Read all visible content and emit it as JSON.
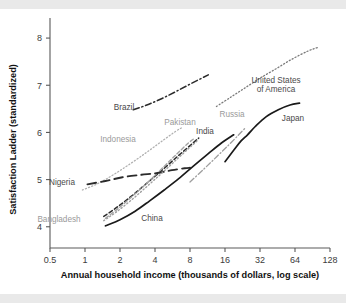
{
  "figure": {
    "background": "#ffffff",
    "band_color": "#e9e9e9"
  },
  "chart_data": {
    "type": "line",
    "title": "",
    "subtitle": "",
    "xlabel": "Annual household income (thousands of dollars, log scale)",
    "ylabel": "Satisfaction Ladder (standardized)",
    "xscale": "log2",
    "xticks": [
      "0.5",
      "1",
      "2",
      "4",
      "8",
      "16",
      "32",
      "64",
      "128"
    ],
    "xtick_values": [
      0.5,
      1,
      2,
      4,
      8,
      16,
      32,
      64,
      128
    ],
    "yticks": [
      "4",
      "5",
      "6",
      "7",
      "8"
    ],
    "ytick_values": [
      4,
      5,
      6,
      7,
      8
    ],
    "xlim": [
      0.5,
      128
    ],
    "ylim": [
      3.55,
      8.15
    ],
    "grid": false,
    "legend": "inline-labels",
    "series": [
      {
        "name": "United States of America",
        "color": "#7a7a7a",
        "style": "dotted",
        "width": 1.3,
        "label_lines": [
          "United States",
          "of America"
        ],
        "label_xy": [
          276,
          74
        ],
        "points": [
          [
            13.5,
            6.55
          ],
          [
            18,
            6.75
          ],
          [
            24,
            6.95
          ],
          [
            32,
            7.15
          ],
          [
            44,
            7.35
          ],
          [
            60,
            7.55
          ],
          [
            82,
            7.72
          ],
          [
            100,
            7.8
          ]
        ]
      },
      {
        "name": "Brazil",
        "color": "#2b2b2b",
        "style": "dashdot",
        "width": 1.5,
        "label_lines": [
          "Brazil"
        ],
        "label_xy": [
          124,
          101
        ],
        "points": [
          [
            2.6,
            6.48
          ],
          [
            3.4,
            6.58
          ],
          [
            4.6,
            6.72
          ],
          [
            6.2,
            6.88
          ],
          [
            8.4,
            7.05
          ],
          [
            11.5,
            7.22
          ]
        ]
      },
      {
        "name": "Japan",
        "color": "#1a1a1a",
        "style": "solid",
        "width": 1.7,
        "label_lines": [
          "Japan"
        ],
        "label_xy": [
          293,
          112
        ],
        "points": [
          [
            16,
            5.38
          ],
          [
            19,
            5.62
          ],
          [
            22,
            5.82
          ],
          [
            25,
            5.95
          ],
          [
            29,
            6.12
          ],
          [
            36,
            6.33
          ],
          [
            46,
            6.48
          ],
          [
            58,
            6.58
          ],
          [
            70,
            6.62
          ]
        ]
      },
      {
        "name": "Russia",
        "color": "#9e9e9e",
        "style": "dashdot",
        "width": 1.3,
        "label_lines": [
          "Russia"
        ],
        "label_xy": [
          232,
          108
        ],
        "points": [
          [
            8.0,
            4.95
          ],
          [
            10.5,
            5.22
          ],
          [
            13.5,
            5.48
          ],
          [
            17,
            5.72
          ],
          [
            21,
            5.95
          ],
          [
            24,
            6.1
          ]
        ]
      },
      {
        "name": "India",
        "color": "#2b2b2b",
        "style": "dashed",
        "width": 1.5,
        "label_lines": [
          "India"
        ],
        "label_xy": [
          205,
          125
        ],
        "points": [
          [
            1.45,
            4.22
          ],
          [
            1.9,
            4.42
          ],
          [
            2.6,
            4.68
          ],
          [
            3.5,
            4.95
          ],
          [
            4.7,
            5.22
          ],
          [
            6.3,
            5.5
          ],
          [
            8.0,
            5.72
          ],
          [
            9.5,
            5.88
          ]
        ]
      },
      {
        "name": "Pakistan",
        "color": "#a3a3a3",
        "style": "dashed",
        "width": 1.4,
        "label_lines": [
          "Pakistan"
        ],
        "label_xy": [
          180,
          116
        ],
        "points": [
          [
            1.5,
            4.18
          ],
          [
            2.0,
            4.42
          ],
          [
            2.7,
            4.7
          ],
          [
            3.6,
            4.98
          ],
          [
            4.8,
            5.28
          ],
          [
            6.2,
            5.55
          ],
          [
            7.8,
            5.78
          ],
          [
            8.8,
            5.88
          ]
        ]
      },
      {
        "name": "Indonesia",
        "color": "#b0b0b0",
        "style": "dotted",
        "width": 1.3,
        "label_lines": [
          "Indonesia"
        ],
        "label_xy": [
          118,
          133
        ],
        "points": [
          [
            0.95,
            4.78
          ],
          [
            1.3,
            4.92
          ],
          [
            1.8,
            5.12
          ],
          [
            2.5,
            5.35
          ],
          [
            3.4,
            5.58
          ],
          [
            4.5,
            5.8
          ],
          [
            6.0,
            6.02
          ],
          [
            6.8,
            6.1
          ]
        ]
      },
      {
        "name": "Nigeria",
        "color": "#2b2b2b",
        "style": "longdash",
        "width": 1.9,
        "label_lines": [
          "Nigeria"
        ],
        "label_xy": [
          62,
          176
        ],
        "points": [
          [
            1.05,
            4.9
          ],
          [
            1.5,
            4.97
          ],
          [
            2.1,
            5.05
          ],
          [
            3.0,
            5.1
          ],
          [
            4.2,
            5.14
          ],
          [
            5.6,
            5.2
          ],
          [
            7.2,
            5.24
          ],
          [
            8.0,
            5.25
          ]
        ]
      },
      {
        "name": "Bangladesh",
        "color": "#a0a0a0",
        "style": "dotted",
        "width": 1.4,
        "label_lines": [
          "Bangladesh"
        ],
        "label_xy": [
          59,
          213
        ],
        "points": [
          [
            1.45,
            4.13
          ],
          [
            1.9,
            4.33
          ],
          [
            2.6,
            4.6
          ],
          [
            3.5,
            4.88
          ],
          [
            4.6,
            5.14
          ],
          [
            6.1,
            5.42
          ],
          [
            7.8,
            5.66
          ],
          [
            9.2,
            5.82
          ]
        ]
      },
      {
        "name": "China",
        "color": "#1a1a1a",
        "style": "solid",
        "width": 1.7,
        "label_lines": [
          "China"
        ],
        "label_xy": [
          152,
          212
        ],
        "points": [
          [
            1.5,
            4.02
          ],
          [
            2.0,
            4.15
          ],
          [
            2.7,
            4.33
          ],
          [
            3.6,
            4.55
          ],
          [
            4.8,
            4.78
          ],
          [
            6.4,
            5.02
          ],
          [
            8.5,
            5.28
          ],
          [
            11.5,
            5.55
          ],
          [
            15,
            5.78
          ],
          [
            19,
            5.95
          ]
        ]
      }
    ]
  }
}
